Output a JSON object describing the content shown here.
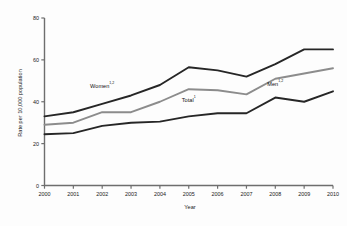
{
  "chart_data": {
    "type": "line",
    "title": "",
    "xlabel": "Year",
    "ylabel": "Rate per 10,000 population",
    "categories": [
      "2000",
      "2001",
      "2002",
      "2003",
      "2004",
      "2005",
      "2006",
      "2007",
      "2008",
      "2009",
      "2010"
    ],
    "x": [
      2000,
      2001,
      2002,
      2003,
      2004,
      2005,
      2006,
      2007,
      2008,
      2009,
      2010
    ],
    "xlim": [
      2000,
      2010
    ],
    "ylim": [
      0,
      80
    ],
    "yticks": [
      0,
      20,
      40,
      60,
      80
    ],
    "ytick_labels": [
      "0",
      "20",
      "40",
      "60",
      "80"
    ],
    "xtick_labels": [
      "2000",
      "2001",
      "2002",
      "2003",
      "2004",
      "2005",
      "2006",
      "2007",
      "2008",
      "2009",
      "2010"
    ],
    "grid": false,
    "legend": "inline-annotations",
    "series": [
      {
        "name": "Women",
        "label": "Women",
        "superscript": "1,2",
        "color": "#262626",
        "values": [
          33,
          35,
          39,
          43,
          48,
          56.5,
          55,
          52,
          58,
          65,
          65
        ]
      },
      {
        "name": "Total",
        "label": "Total",
        "superscript": "1",
        "color": "#8c8c8c",
        "values": [
          29,
          30,
          35,
          35,
          40,
          46,
          45.5,
          43.5,
          51,
          53.5,
          56
        ]
      },
      {
        "name": "Men",
        "label": "Men",
        "superscript": "1,2",
        "color": "#262626",
        "values": [
          24.5,
          25,
          28.5,
          30,
          30.5,
          33,
          34.5,
          34.5,
          42,
          40,
          45
        ]
      }
    ],
    "annotations": [
      {
        "text": "Women",
        "superscript": "1,2",
        "x": 2002.0,
        "y": 46.5
      },
      {
        "text": "Total",
        "superscript": "1",
        "x": 2005.0,
        "y": 40.0
      },
      {
        "text": "Men",
        "superscript": "1,2",
        "x": 2008.0,
        "y": 47.5
      }
    ]
  },
  "axes": {
    "ylabel": "Rate per 10,000 population",
    "xlabel": "Year"
  }
}
